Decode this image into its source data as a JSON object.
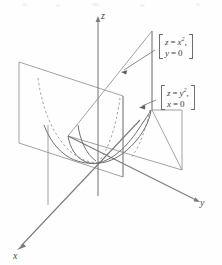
{
  "figure": {
    "axes": {
      "x_label": "x",
      "y_label": "y",
      "z_label": "z"
    },
    "annotations": [
      {
        "id": "trace-xz",
        "line1_lhs": "z",
        "line1_eq": "=",
        "line1_rhs": "x",
        "line1_exp": "2",
        "line1_tail": ",",
        "line2_lhs": "y",
        "line2_eq": "=",
        "line2_rhs": "0"
      },
      {
        "id": "trace-yz",
        "line1_lhs": "z",
        "line1_eq": "=",
        "line1_rhs": "y",
        "line1_exp": "2",
        "line1_tail": ",",
        "line2_lhs": "x",
        "line2_eq": "=",
        "line2_rhs": "0"
      }
    ],
    "colors": {
      "line": "#808080",
      "line_dark": "#6b6b6b",
      "dashed": "#9a9a9a",
      "text": "#3d3d3d",
      "background": "#fefefe"
    },
    "geometry": {
      "origin": [
        98,
        163
      ],
      "z_axis_top": [
        98,
        18
      ],
      "y_axis_end": [
        200,
        201
      ],
      "x_axis_end": [
        16,
        250
      ],
      "xz_plane_corners": [
        [
          19,
          62
        ],
        [
          123,
          96
        ],
        [
          123,
          177
        ],
        [
          19,
          143
        ]
      ],
      "yz_plane_corners": [
        [
          152,
          31
        ],
        [
          152,
          110
        ],
        [
          182,
          170
        ],
        [
          68,
          136
        ]
      ]
    }
  }
}
